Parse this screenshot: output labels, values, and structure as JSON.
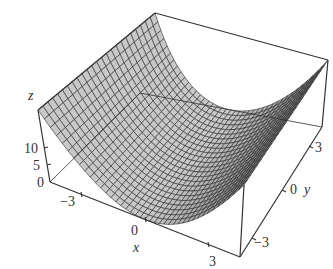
{
  "chart_data": {
    "type": "surface3d",
    "title": "",
    "function": "z = x^2 (parabolic cylinder)",
    "xlabel": "x",
    "ylabel": "y",
    "zlabel": "z",
    "x_ticks": [
      "-3",
      "0",
      "3"
    ],
    "y_ticks": [
      "-3",
      "0",
      "3"
    ],
    "z_ticks": [
      "0",
      "5",
      "10"
    ],
    "x_range": [
      -3,
      3
    ],
    "y_range": [
      -3,
      3
    ],
    "z_range": [
      0,
      21
    ],
    "mesh": {
      "nx": 40,
      "ny": 24
    },
    "colors": {
      "surface": "#c8c8c8",
      "mesh": "#2a2a2a",
      "box": "#333333"
    }
  },
  "labels": {
    "z_axis": "z",
    "x_axis": "x",
    "y_axis": "y",
    "z10": "10",
    "z5": "5",
    "z0": "0",
    "xm3": "−3",
    "x0": "0",
    "x3": "3",
    "ym3": "−3",
    "y0": "0",
    "y3": "3"
  }
}
